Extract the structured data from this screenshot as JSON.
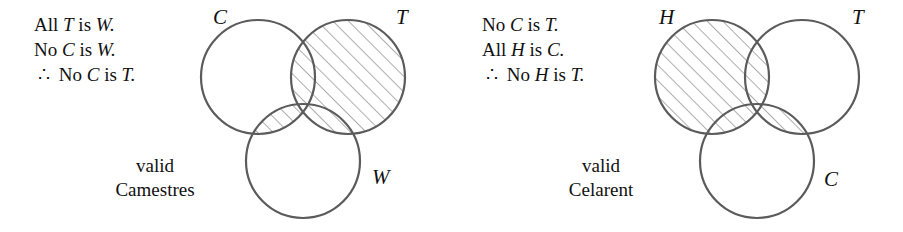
{
  "figure": {
    "title_text_present": false,
    "background_color": "#ffffff",
    "stroke_color": "#5b5b5b",
    "text_color": "#111111",
    "hatch_color": "#6a6a6a"
  },
  "panels": [
    {
      "id": "camestres",
      "premises": [
        {
          "quantifier": "All",
          "subject": "T",
          "copula": "is",
          "predicate": "W.",
          "text": "All T is W."
        },
        {
          "quantifier": "No",
          "subject": "C",
          "copula": "is",
          "predicate": "W.",
          "text": "No C is W."
        }
      ],
      "conclusion": {
        "symbol": "∴",
        "quantifier": "No",
        "subject": "C",
        "copula": "is",
        "predicate": "T.",
        "text": "∴ No C is T."
      },
      "verdict": {
        "status": "valid",
        "mood_name": "Camestres"
      },
      "diagram": {
        "type": "venn-3-circle",
        "circles": [
          {
            "name": "C",
            "label": "C",
            "cx": 258,
            "cy": 77,
            "r": 57,
            "label_x": 213,
            "label_y": 24
          },
          {
            "name": "T",
            "label": "T",
            "cx": 348,
            "cy": 77,
            "r": 57,
            "label_x": 396,
            "label_y": 24
          },
          {
            "name": "W",
            "label": "W",
            "cx": 303,
            "cy": 161,
            "r": 57,
            "label_x": 372,
            "label_y": 184
          }
        ],
        "shaded_regions": [
          {
            "description": "entire T circle",
            "kind": "whole-circle",
            "sets": [
              "T"
            ]
          },
          {
            "description": "intersection of C and W",
            "kind": "intersection",
            "sets": [
              "C",
              "W"
            ]
          }
        ]
      }
    },
    {
      "id": "celarent",
      "premises": [
        {
          "quantifier": "No",
          "subject": "C",
          "copula": "is",
          "predicate": "T.",
          "text": "No C is T."
        },
        {
          "quantifier": "All",
          "subject": "H",
          "copula": "is",
          "predicate": "C.",
          "text": "All H is C."
        }
      ],
      "conclusion": {
        "symbol": "∴",
        "quantifier": "No",
        "subject": "H",
        "copula": "is",
        "predicate": "T.",
        "text": "∴ No H is T."
      },
      "verdict": {
        "status": "valid",
        "mood_name": "Celarent"
      },
      "diagram": {
        "type": "venn-3-circle",
        "circles": [
          {
            "name": "H",
            "label": "H",
            "cx": 260,
            "cy": 77,
            "r": 57,
            "label_x": 207,
            "label_y": 24
          },
          {
            "name": "T",
            "label": "T",
            "cx": 350,
            "cy": 77,
            "r": 57,
            "label_x": 400,
            "label_y": 24
          },
          {
            "name": "C",
            "label": "C",
            "cx": 305,
            "cy": 161,
            "r": 57,
            "label_x": 372,
            "label_y": 186
          }
        ],
        "shaded_regions": [
          {
            "description": "entire H circle",
            "kind": "whole-circle",
            "sets": [
              "H"
            ]
          },
          {
            "description": "intersection of T and C",
            "kind": "intersection",
            "sets": [
              "T",
              "C"
            ]
          }
        ]
      }
    }
  ]
}
